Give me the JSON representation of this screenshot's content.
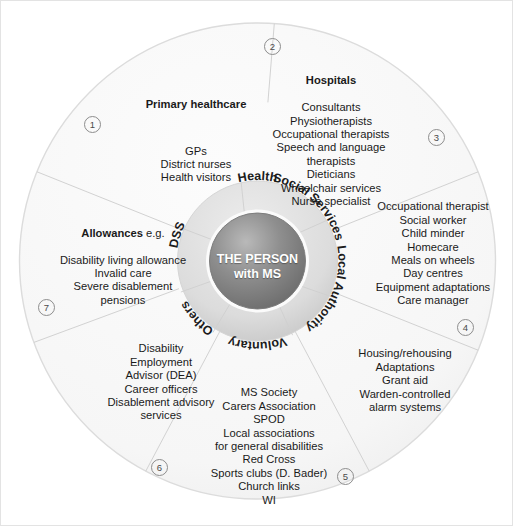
{
  "diagram": {
    "center": {
      "line1": "THE PERSON",
      "line2": "with MS"
    },
    "ring_labels": [
      {
        "id": "health",
        "label": "Health"
      },
      {
        "id": "social-services",
        "label": "Social Services"
      },
      {
        "id": "local-authority",
        "label": "Local Authority"
      },
      {
        "id": "voluntary",
        "label": "Voluntary"
      },
      {
        "id": "others",
        "label": "Others"
      },
      {
        "id": "dss",
        "label": "DSS"
      }
    ],
    "sectors": [
      {
        "id": "primary-healthcare",
        "marker": "1",
        "heading": "Primary healthcare",
        "heading_suffix": "",
        "items": [
          "GPs",
          "District nurses",
          "Health visitors"
        ]
      },
      {
        "id": "hospitals",
        "marker": "2",
        "heading": "Hospitals",
        "heading_suffix": "",
        "items": [
          "Consultants",
          "Physiotherapists",
          "Occupational therapists",
          "Speech and language",
          "therapists",
          "Dieticians",
          "Wheelchair services",
          "Nurse specialist"
        ]
      },
      {
        "id": "social-services",
        "marker": "3",
        "heading": "",
        "heading_suffix": "",
        "items": [
          "Occupational therapist",
          "Social worker",
          "Child minder",
          "Homecare",
          "Meals on wheels",
          "Day centres",
          "Equipment adaptations",
          "Care manager"
        ]
      },
      {
        "id": "local-authority",
        "marker": "4",
        "heading": "",
        "heading_suffix": "",
        "items": [
          "Housing/rehousing",
          "Adaptations",
          "Grant aid",
          "Warden-controlled",
          "alarm systems"
        ]
      },
      {
        "id": "voluntary",
        "marker": "5",
        "heading": "",
        "heading_suffix": "",
        "items": [
          "MS Society",
          "Carers Association",
          "SPOD",
          "Local associations",
          "for general disabilities",
          "Red Cross",
          "Sports clubs (D. Bader)",
          "Church links",
          "WI"
        ]
      },
      {
        "id": "others-employment",
        "marker": "6",
        "heading": "",
        "heading_suffix": "",
        "items": [
          "Disability",
          "Employment",
          "Advisor (DEA)",
          "Career officers",
          "Disablement advisory",
          "services"
        ]
      },
      {
        "id": "allowances-dss",
        "marker": "7",
        "heading": "Allowances",
        "heading_suffix": " e.g.",
        "items": [
          "Disability living allowance",
          "Invalid care",
          "Severe disablement",
          "pensions"
        ]
      }
    ],
    "colors": {
      "background": "#ffffff",
      "outer_fill": "#f7f7f7",
      "outer_stroke": "#d8d8d8",
      "divider": "#d0d0d0",
      "ring_fill_light": "#e2e2e2",
      "ring_fill_dark": "#c9c9c9",
      "core_dark": "#6e6e6e",
      "core_light": "#bdbdbd",
      "text": "#1a1a1a",
      "center_text": "#ffffff",
      "marker_stroke": "#8d8d8d"
    }
  }
}
